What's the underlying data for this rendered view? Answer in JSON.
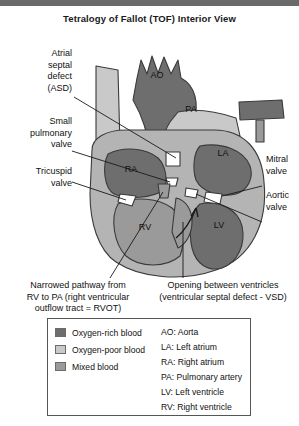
{
  "title": "Tetralogy of Fallot (TOF) Interior View",
  "labels": {
    "asd": "Atrial\nseptal\ndefect\n(ASD)",
    "small_pulmonary_valve": "Small\npulmonary\nvalve",
    "tricuspid_valve": "Tricuspid\nvalve",
    "mitral_valve": "Mitral\nvalve",
    "aortic_valve": "Aortic\nvalve",
    "rvot": "Narrowed pathway from\nRV to PA (right ventricular\noutflow tract = RVOT)",
    "vsd": "Opening between ventricles\n(ventricular septal defect - VSD)"
  },
  "anatomy_labels": {
    "ao": "AO",
    "pa": "PA",
    "la": "LA",
    "ra": "RA",
    "rv": "RV",
    "lv": "LV"
  },
  "legend": {
    "blood_types": [
      {
        "label": "Oxygen-rich blood",
        "color": "#6e6e6e"
      },
      {
        "label": "Oxygen-poor blood",
        "color": "#c9c9c9"
      },
      {
        "label": "Mixed blood",
        "color": "#9a9a9a"
      }
    ],
    "abbreviations": [
      "AO: Aorta",
      "LA: Left atrium",
      "RA: Right atrium",
      "PA: Pulmonary artery",
      "LV: Left ventricle",
      "RV: Right ventricle"
    ]
  },
  "colors": {
    "oxygen_rich": "#6e6e6e",
    "oxygen_poor": "#c9c9c9",
    "mixed": "#9a9a9a",
    "outline": "#3a3a3a",
    "topbar": "#6a6a6a",
    "muscle": "#b4b4b4"
  }
}
